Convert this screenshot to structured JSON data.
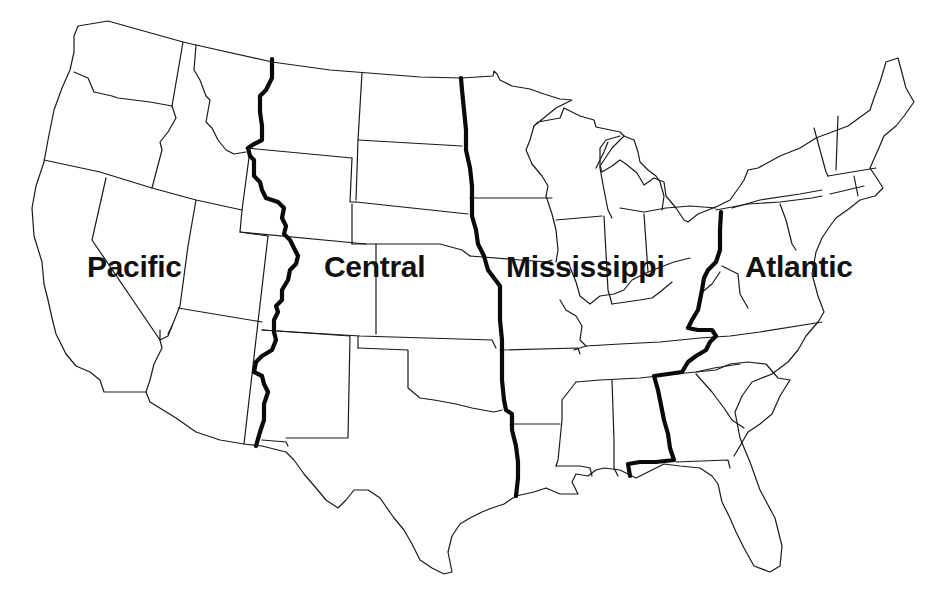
{
  "map": {
    "title": "United States Region Divisions",
    "regions": [
      {
        "id": "pacific",
        "label": "Pacific",
        "x": 87,
        "y": 252
      },
      {
        "id": "central",
        "label": "Central",
        "x": 324,
        "y": 252
      },
      {
        "id": "mississippi",
        "label": "Mississippi",
        "x": 506,
        "y": 252
      },
      {
        "id": "atlantic",
        "label": "Atlantic",
        "x": 745,
        "y": 252
      }
    ],
    "dividers": [
      {
        "id": "pacific-central",
        "description": "Thick boundary line between Pacific and Central regions"
      },
      {
        "id": "central-mississippi",
        "description": "Thick boundary line between Central and Mississippi regions"
      },
      {
        "id": "mississippi-atlantic",
        "description": "Thick boundary line between Mississippi and Atlantic regions"
      }
    ],
    "colors": {
      "background": "#ffffff",
      "outline": "#1a1a1a",
      "divider": "#0a0a0a",
      "label": "#111111"
    }
  }
}
